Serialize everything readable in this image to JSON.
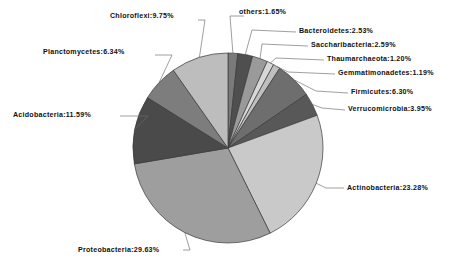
{
  "chart_data": {
    "type": "pie",
    "title": "",
    "subtitle": "",
    "xlabel": "",
    "ylabel": "",
    "grid": false,
    "legend_position": "none",
    "label_format": "name:percent%",
    "units": "percent",
    "total": 100.0,
    "start_angle_deg": 0,
    "direction": "clockwise",
    "categories": [
      "others",
      "Bacteroidetes",
      "Saccharibacteria",
      "Thaumarchaeota",
      "Gemmatimonadetes",
      "Firmicutes",
      "Verrucomicrobia",
      "Actinobacteria",
      "Proteobacteria",
      "Acidobacteria",
      "Planctomycetes",
      "Chloroflexi"
    ],
    "values": [
      1.65,
      2.53,
      2.59,
      1.2,
      1.19,
      6.3,
      3.95,
      23.28,
      29.63,
      11.59,
      6.34,
      9.75
    ],
    "colors": [
      "#7a7a7a",
      "#4f4f4f",
      "#9a9a9a",
      "#d8d8d8",
      "#bfbfbf",
      "#6e6e6e",
      "#585858",
      "#c9c9c9",
      "#9e9e9e",
      "#4a4a4a",
      "#7d7d7d",
      "#bdbdbd"
    ],
    "slices": [
      {
        "name": "others",
        "value": 1.65,
        "label": "others:1.65%",
        "color": "#7a7a7a"
      },
      {
        "name": "Bacteroidetes",
        "value": 2.53,
        "label": "Bacteroidetes:2.53%",
        "color": "#4f4f4f"
      },
      {
        "name": "Saccharibacteria",
        "value": 2.59,
        "label": "Saccharibacteria:2.59%",
        "color": "#9a9a9a"
      },
      {
        "name": "Thaumarchaeota",
        "value": 1.2,
        "label": "Thaumarchaeota:1.20%",
        "color": "#d8d8d8"
      },
      {
        "name": "Gemmatimonadetes",
        "value": 1.19,
        "label": "Gemmatimonadetes:1.19%",
        "color": "#bfbfbf"
      },
      {
        "name": "Firmicutes",
        "value": 6.3,
        "label": "Firmicutes:6.30%",
        "color": "#6e6e6e"
      },
      {
        "name": "Verrucomicrobia",
        "value": 3.95,
        "label": "Verrucomicrobia:3.95%",
        "color": "#585858"
      },
      {
        "name": "Actinobacteria",
        "value": 23.28,
        "label": "Actinobacteria:23.28%",
        "color": "#c9c9c9"
      },
      {
        "name": "Proteobacteria",
        "value": 29.63,
        "label": "Proteobacteria:29.63%",
        "color": "#9e9e9e"
      },
      {
        "name": "Acidobacteria",
        "value": 11.59,
        "label": "Acidobacteria:11.59%",
        "color": "#4a4a4a"
      },
      {
        "name": "Planctomycetes",
        "value": 6.34,
        "label": "Planctomycetes:6.34%",
        "color": "#7d7d7d"
      },
      {
        "name": "Chloroflexi",
        "value": 9.75,
        "label": "Chloroflexi:9.75%",
        "color": "#bdbdbd"
      }
    ]
  },
  "labels": {
    "others": "others:1.65%",
    "bacteroidetes": "Bacteroidetes:2.53%",
    "saccharibacteria": "Saccharibacteria:2.59%",
    "thaumarchaeota": "Thaumarchaeota:1.20%",
    "gemmatimonadetes": "Gemmatimonadetes:1.19%",
    "firmicutes": "Firmicutes:6.30%",
    "verrucomicrobia": "Verrucomicrobia:3.95%",
    "actinobacteria": "Actinobacteria:23.28%",
    "proteobacteria": "Proteobacteria:29.63%",
    "acidobacteria": "Acidobacteria:11.59%",
    "planctomycetes": "Planctomycetes:6.34%",
    "chloroflexi": "Chloroflexi:9.75%"
  },
  "style": {
    "background": "#ffffff",
    "outline": "#3a3a3a",
    "leader_line": "#6b6b6b",
    "text": "#101010"
  }
}
